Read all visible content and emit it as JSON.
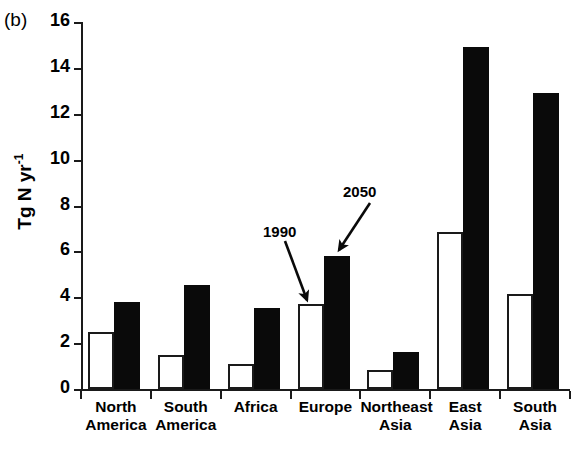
{
  "panel": {
    "label": "(b)"
  },
  "axes": {
    "ylabel_main": "Tg N yr",
    "ylabel_exponent": "-1",
    "ytick_labels": [
      "0",
      "2",
      "4",
      "6",
      "8",
      "10",
      "12",
      "14",
      "16"
    ],
    "ymin": 0,
    "ymax": 16
  },
  "annotations": {
    "a1_label": "1990",
    "a2_label": "2050"
  },
  "groups": [
    {
      "label": "North\nAmerica"
    },
    {
      "label": "South\nAmerica"
    },
    {
      "label": "Africa"
    },
    {
      "label": "Europe"
    },
    {
      "label": "Northeast\nAsia"
    },
    {
      "label": "East\nAsia"
    },
    {
      "label": "South\nAsia"
    }
  ],
  "colors": {
    "series_1990": "#ffffff",
    "series_2050": "#000000",
    "axis": "#1a1a1a",
    "background": "#ffffff"
  },
  "chart_data": {
    "type": "bar",
    "title": "(b)",
    "xlabel": "",
    "ylabel": "Tg N yr-1",
    "ylim": [
      0,
      16
    ],
    "ytick_values": [
      0,
      2,
      4,
      6,
      8,
      10,
      12,
      14,
      16
    ],
    "grid": false,
    "legend": "none (series identified by arrow annotations)",
    "categories": [
      "North America",
      "South America",
      "Africa",
      "Europe",
      "Northeast Asia",
      "East Asia",
      "South Asia"
    ],
    "series": [
      {
        "name": "1990",
        "style": "open/white bar",
        "values": [
          2.5,
          1.5,
          1.1,
          3.7,
          0.85,
          6.85,
          4.15
        ]
      },
      {
        "name": "2050",
        "style": "filled/black bar",
        "values": [
          3.8,
          4.55,
          3.55,
          5.8,
          1.6,
          14.9,
          12.9
        ]
      }
    ],
    "annotations": [
      {
        "text": "1990",
        "points_to": "Europe open bar"
      },
      {
        "text": "2050",
        "points_to": "Europe filled bar"
      }
    ]
  }
}
